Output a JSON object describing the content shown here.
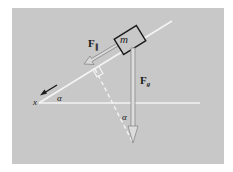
{
  "diagram": {
    "colors": {
      "background": "#c8c8c8",
      "frame": "#ffffff",
      "line": "#f2f2f2",
      "ink": "#1a1a1a",
      "arrow_outline": "#8a8a8a"
    },
    "labels": {
      "mass": "m",
      "parallel_force": "F",
      "parallel_force_sub": "∥",
      "gravity_force": "F",
      "gravity_force_sub": "g",
      "axis": "x",
      "angle_base": "α",
      "angle_lower": "α"
    }
  }
}
